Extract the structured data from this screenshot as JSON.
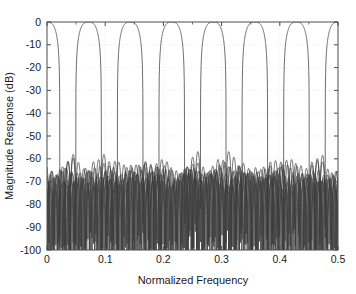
{
  "chart_data": {
    "type": "line",
    "title": "",
    "xlabel": "Normalized Frequency",
    "ylabel": "Magnitude Response (dB)",
    "xlim": [
      0,
      0.5
    ],
    "ylim": [
      -100,
      0
    ],
    "grid": true,
    "legend_position": "none",
    "xticks": [
      0,
      0.1,
      0.2,
      0.3,
      0.4,
      0.5
    ],
    "xtick_labels": [
      "0",
      "0.1",
      "0.2",
      "0.3",
      "0.4",
      "0.5"
    ],
    "xminor_ticks": [
      0.05,
      0.15,
      0.25,
      0.35,
      0.45
    ],
    "yticks": [
      0,
      -10,
      -20,
      -30,
      -40,
      -50,
      -60,
      -70,
      -80,
      -90,
      -100
    ],
    "ytick_labels": [
      "0",
      "-10",
      "-20",
      "-30",
      "-40",
      "-50",
      "-60",
      "-70",
      "-80",
      "-90",
      "-100"
    ],
    "line_color": "#3c3c3c",
    "line_width": 0.75,
    "background_color": "#ffffff",
    "axis_color": "#4d4d4d",
    "grid_color": "#d8d8d8",
    "num_channels": 7,
    "channel_spacing": 0.0714,
    "passband_level_db": 0,
    "crossover_level_db": -3,
    "peak_sidelobe_db": -60,
    "sidelobe_floor_db": -95,
    "transition_sharpness": 0.022,
    "sidelobe_ripple_period": 0.0092,
    "channel_centers": [
      0,
      0.0714,
      0.1429,
      0.2143,
      0.2857,
      0.3571,
      0.4286,
      0.5
    ],
    "series": [
      {
        "name": "Channel 1",
        "center": 0.0,
        "peak_db": 0
      },
      {
        "name": "Channel 2",
        "center": 0.0714,
        "peak_db": 0
      },
      {
        "name": "Channel 3",
        "center": 0.1429,
        "peak_db": 0
      },
      {
        "name": "Channel 4",
        "center": 0.2143,
        "peak_db": 0
      },
      {
        "name": "Channel 5",
        "center": 0.2857,
        "peak_db": 0
      },
      {
        "name": "Channel 6",
        "center": 0.3571,
        "peak_db": 0
      },
      {
        "name": "Channel 7",
        "center": 0.4286,
        "peak_db": 0
      },
      {
        "name": "Channel 8",
        "center": 0.5,
        "peak_db": 0
      }
    ]
  }
}
